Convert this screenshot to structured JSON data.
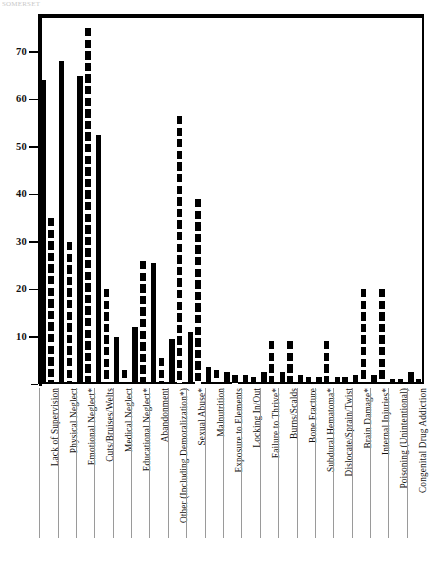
{
  "page": {
    "top_fragment": "SOMERSET",
    "background": "#ffffff",
    "ink_color": "#000000"
  },
  "chart_data": {
    "type": "bar",
    "title": "",
    "subtitle": "",
    "xlabel": "",
    "ylabel": "",
    "ylim": [
      0,
      78
    ],
    "yticks": [
      10,
      20,
      30,
      40,
      50,
      60,
      70
    ],
    "grid": false,
    "legend_position": "none",
    "orientation": "vertical",
    "bar_style": [
      "solid",
      "dashed"
    ],
    "categories": [
      "Lack of Supervision",
      "Physical Neglect",
      "Emotional Neglect*",
      "Cuts/Bruises/Welts",
      "Medical Neglect",
      "Educational Neglect*",
      "Abandonment",
      "Other (Including Demoralization*)",
      "Sexual Abuse*",
      "Malnutrition",
      "Exposure to Elements",
      "Locking In/Out",
      "Failure to Thrive*",
      "Burns/Scalds",
      "Bone Fracture",
      "Subdural Hematoma*",
      "Dislocate/Sprain/Twist",
      "Brain Damage*",
      "Internal Injuries*",
      "Poisoning (Unintentional)",
      "Congenital Drug Addiction"
    ],
    "series": [
      {
        "name": "Solid",
        "style": "solid",
        "values": [
          64,
          68,
          65,
          52.5,
          10,
          12,
          25.5,
          9.5,
          11,
          3.5,
          2.5,
          2,
          2.5,
          2.5,
          2,
          1.5,
          1.5,
          2,
          2,
          1,
          2.5
        ]
      },
      {
        "name": "Dashed",
        "style": "dashed",
        "values": [
          35,
          30,
          75,
          20,
          3,
          26,
          5.5,
          56.5,
          39,
          3,
          2,
          1.5,
          9,
          9,
          1.5,
          9,
          1.5,
          20,
          20,
          1,
          1
        ]
      }
    ]
  }
}
